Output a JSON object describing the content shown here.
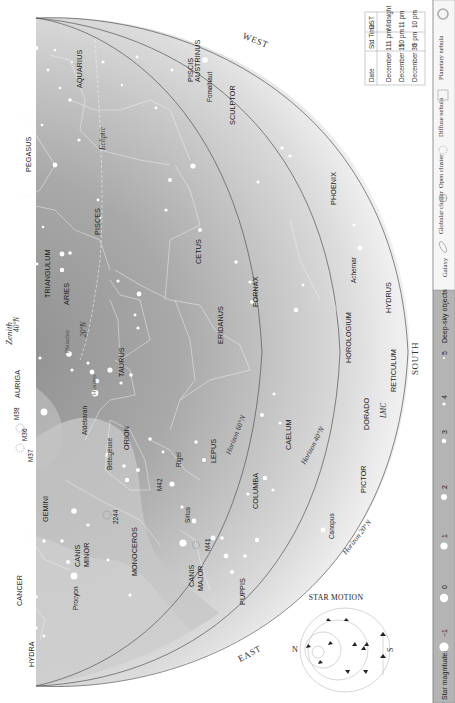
{
  "chart": {
    "orientation": "rotated-90-clockwise",
    "colors": {
      "sky_dark": "#9a9a9a",
      "sky_mid": "#bdbdbd",
      "sky_light": "#e6e6e6",
      "milky_way": "#c9c9c9",
      "legend_bar": "#b3b3b3",
      "star": "#ffffff",
      "horizon_line": "#555555"
    },
    "directions": {
      "west": "WEST",
      "south": "SOUTH",
      "east": "EAST",
      "zenith": "Zenith"
    },
    "horizon_labels": {
      "h60": "Horizon 60°N",
      "h40": "Horizon 40°N",
      "h20": "Horizon 20°N",
      "zenith_40": "40°N",
      "zenith_20": "20°N"
    },
    "ecliptic_label": "Ecliptic",
    "constellations": [
      "AQUARIUS",
      "PISCIS",
      "AUSTRINUS",
      "SCULPTOR",
      "PEGASUS",
      "PISCES",
      "PHOENIX",
      "CETUS",
      "TRIANGULUM",
      "ARIES",
      "FORNAX",
      "ERIDANUS",
      "HOROLOGIUM",
      "HYDRUS",
      "AURIGA",
      "TAURUS",
      "RETICULUM",
      "ORION",
      "DORADO",
      "CAELUM",
      "LEPUS",
      "GEMINI",
      "COLUMBA",
      "PICTOR",
      "MONOCEROS",
      "CANIS",
      "MINOR",
      "CANIS",
      "MAJOR",
      "CANCER",
      "PUPPIS",
      "HYDRA"
    ],
    "stars": {
      "fomalhaut": "Fomalhaut",
      "achernar": "Achernar",
      "aldebaran": "Aldebaran",
      "betelgeuse": "Betelgeuse",
      "rigel": "Rigel",
      "sirius": "Sirius",
      "procyon": "Procyon",
      "canopus": "Canopus"
    },
    "objects": {
      "pleiades": "Pleiades",
      "hyades": "Hyades",
      "m38": "M38",
      "m36": "M36",
      "m37": "M37",
      "m42": "M42",
      "m41": "M41",
      "ngc2244": "2244",
      "lmc": "LMC"
    }
  },
  "time_table": {
    "headers": [
      "Date",
      "Std Time",
      "DST"
    ],
    "rows": [
      [
        "December 1",
        "11 pm",
        "Midnight"
      ],
      [
        "December 15",
        "10 pm",
        "11 pm"
      ],
      [
        "December 30",
        "9 pm",
        "10 pm"
      ]
    ]
  },
  "star_motion": {
    "title": "STAR MOTION",
    "n_label": "N",
    "s_label": "S"
  },
  "legend": {
    "magnitudes_label": "Star magnitudes",
    "magnitudes": [
      "−1",
      "0",
      "1",
      "2",
      "3",
      "4",
      "5"
    ],
    "deep_sky_label": "Deep-sky objects",
    "deep_sky": [
      {
        "label": "Galaxy",
        "icon": "galaxy-icon"
      },
      {
        "label": "Globular cluster",
        "icon": "globular-cluster-icon"
      },
      {
        "label": "Open cluster",
        "icon": "open-cluster-icon"
      },
      {
        "label": "Diffuse nebula",
        "icon": "diffuse-nebula-icon"
      },
      {
        "label": "Planetary nebula",
        "icon": "planetary-nebula-icon"
      }
    ]
  }
}
